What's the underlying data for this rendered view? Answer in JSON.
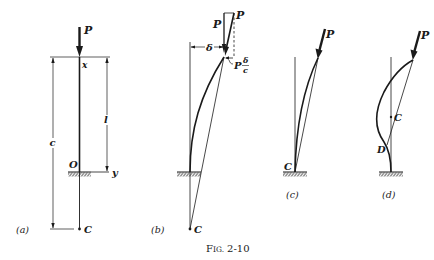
{
  "figure": {
    "caption": "Fig. 2-10",
    "caption_prefix": "F",
    "caption_smallcaps": "IG.",
    "caption_number": "2-10",
    "panels": [
      {
        "id": "a",
        "label": "(a)",
        "load": "P",
        "axis_x": "x",
        "axis_y": "y",
        "origin": "O",
        "point": "C",
        "dim_total": "c",
        "dim_length": "l"
      },
      {
        "id": "b",
        "label": "(b)",
        "load_vertical": "P",
        "load_inclined": "P",
        "deflection": "δ",
        "horizontal_force_prefix": "P",
        "horizontal_force_num": "δ",
        "horizontal_force_den": "c",
        "point": "C"
      },
      {
        "id": "c",
        "label": "(c)",
        "load": "P",
        "point": "C"
      },
      {
        "id": "d",
        "label": "(d)",
        "load": "P",
        "point_c": "C",
        "point_d": "D"
      }
    ]
  }
}
